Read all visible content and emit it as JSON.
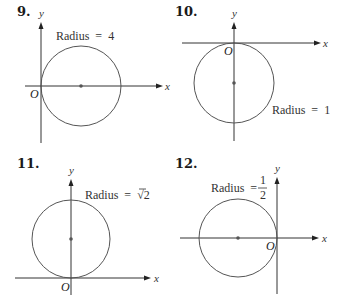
{
  "panels": [
    {
      "number": "9.",
      "x_label": "x",
      "y_label": "y",
      "origin_label": "O",
      "radius_label": "Radius",
      "equals": "=",
      "radius_value": "4",
      "description": "Circle of radius 4 tangent to y-axis at origin, center on positive x-axis"
    },
    {
      "number": "10.",
      "x_label": "x",
      "y_label": "y",
      "origin_label": "O",
      "radius_label": "Radius",
      "equals": "=",
      "radius_value": "1",
      "description": "Circle of radius 1 tangent to x-axis at origin, center on negative y-axis"
    },
    {
      "number": "11.",
      "x_label": "x",
      "y_label": "y",
      "origin_label": "O",
      "radius_label": "Radius",
      "equals": "=",
      "radius_value": "2",
      "radius_sqrt": "√",
      "description": "Circle of radius √2 tangent to x-axis at origin, center on positive y-axis"
    },
    {
      "number": "12.",
      "x_label": "x",
      "y_label": "y",
      "origin_label": "O",
      "radius_label": "Radius",
      "equals": "=",
      "radius_num": "1",
      "radius_den": "2",
      "description": "Circle of radius 1/2 tangent to y-axis at origin, center on negative x-axis"
    }
  ],
  "colors": {
    "axis": "#333333",
    "circle": "#555555",
    "text": "#1a1a1a",
    "background": "#ffffff"
  }
}
